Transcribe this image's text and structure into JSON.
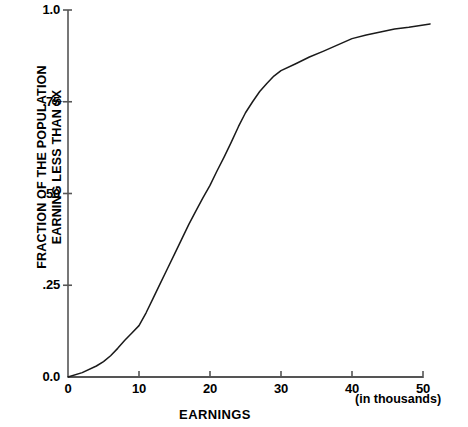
{
  "chart_data": {
    "type": "line",
    "title": "",
    "subtitle": "",
    "xlabel": "EARNINGS",
    "xlabel_note": "(in thousands)",
    "ylabel_line1": "FRACTION OF THE POPULATION",
    "ylabel_line2": "EARNING LESS THAN $X",
    "xlim": [
      0,
      51
    ],
    "ylim": [
      0,
      1.0
    ],
    "grid": false,
    "legend": "none",
    "line_color": "#1a1a1a",
    "axis_color": "#555555",
    "background_color": "#ffffff",
    "xticks": [
      0,
      10,
      20,
      30,
      40,
      50
    ],
    "xtick_labels": [
      "0",
      "10",
      "20",
      "30",
      "40",
      "50"
    ],
    "yticks": [
      0.0,
      0.25,
      0.5,
      0.75,
      1.0
    ],
    "ytick_labels": [
      "0.0",
      ".25",
      ".50",
      ".75",
      "1.0"
    ],
    "series": [
      {
        "name": "cumulative earnings distribution",
        "x": [
          0,
          2,
          4,
          5,
          6,
          7,
          8,
          9,
          10,
          11,
          12,
          13,
          14,
          15,
          16,
          17,
          18,
          19,
          20,
          21,
          22,
          23,
          24,
          25,
          26,
          27,
          28,
          29,
          30,
          32,
          34,
          36,
          38,
          40,
          42,
          44,
          46,
          48,
          51
        ],
        "y": [
          0.0,
          0.012,
          0.03,
          0.042,
          0.058,
          0.078,
          0.1,
          0.12,
          0.14,
          0.175,
          0.215,
          0.255,
          0.295,
          0.335,
          0.375,
          0.415,
          0.452,
          0.488,
          0.522,
          0.562,
          0.6,
          0.64,
          0.682,
          0.72,
          0.75,
          0.778,
          0.8,
          0.82,
          0.835,
          0.853,
          0.872,
          0.888,
          0.905,
          0.922,
          0.932,
          0.94,
          0.948,
          0.953,
          0.962
        ]
      }
    ]
  }
}
